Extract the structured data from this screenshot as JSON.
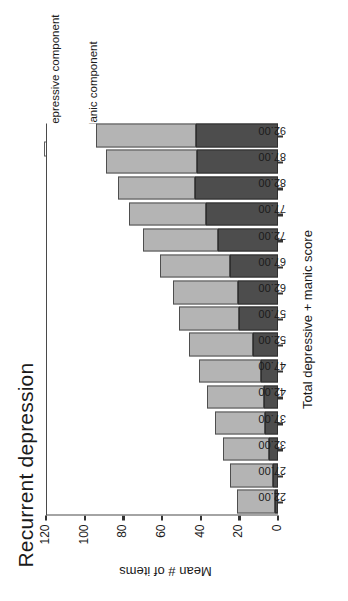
{
  "chart_data": {
    "type": "bar",
    "stacked": true,
    "title": "Recurrent depression",
    "xlabel": "Total depressive + manic score",
    "ylabel": "Mean # of items",
    "categories": [
      "22.00",
      "27.00",
      "32.00",
      "37.00",
      "42.00",
      "47.00",
      "52.00",
      "57.00",
      "62.00",
      "67.00",
      "72.00",
      "77.00",
      "82.00",
      "87.00",
      "92.00"
    ],
    "series": [
      {
        "name": "Manic component",
        "color": "#4d4d4d",
        "values": [
          1.5,
          2.5,
          4.5,
          6.5,
          7.5,
          9.0,
          13.0,
          20.0,
          20.5,
          25.0,
          31.0,
          37.0,
          43.0,
          42.0,
          42.5
        ]
      },
      {
        "name": "Depressive component",
        "color": "#b4b4b4",
        "values": [
          19.5,
          22.5,
          24.0,
          26.0,
          29.0,
          32.0,
          33.0,
          31.0,
          34.0,
          36.0,
          39.0,
          40.0,
          40.0,
          47.0,
          51.5
        ]
      }
    ],
    "totals": [
      21.0,
      25.0,
      28.5,
      32.5,
      36.5,
      41.0,
      46.0,
      51.0,
      54.5,
      61.0,
      70.0,
      77.0,
      83.0,
      89.0,
      94.0
    ],
    "yticks": [
      "0",
      "20",
      "40",
      "60",
      "80",
      "100",
      "120"
    ],
    "ylim": [
      0,
      120
    ],
    "grid": false,
    "legend_position": "top-right",
    "axis_frame": "left-top-open"
  },
  "legend": {
    "items": [
      {
        "label": "Depressive component",
        "swatch": "light-gray-swatch"
      },
      {
        "label": "Manic component",
        "swatch": "dark-gray-swatch"
      }
    ]
  },
  "colors": {
    "depressive": "#b4b4b4",
    "manic": "#4d4d4d",
    "axis": "#4a4a4a",
    "text": "#1b1b1b",
    "background": "#ffffff"
  }
}
